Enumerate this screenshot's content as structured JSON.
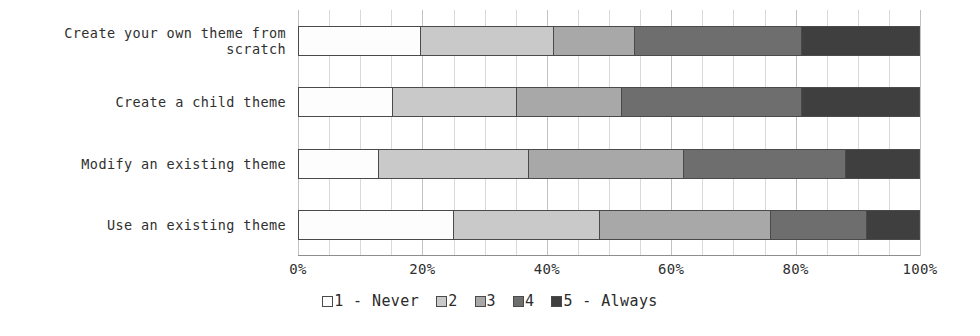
{
  "chart_data": {
    "type": "bar",
    "orientation": "horizontal",
    "stacked": true,
    "normalized_percent": true,
    "title": "",
    "subtitle": "",
    "xlabel": "",
    "ylabel": "",
    "xlim": [
      0,
      100
    ],
    "xticks": [
      "0%",
      "20%",
      "40%",
      "60%",
      "80%",
      "100%"
    ],
    "xtick_values": [
      0,
      20,
      40,
      60,
      80,
      100
    ],
    "grid": true,
    "grid_minor_step": 5,
    "legend_position": "bottom",
    "categories": [
      "Create your own theme from scratch",
      "Create a child theme",
      "Modify an existing theme",
      "Use an existing theme"
    ],
    "category_lines": [
      [
        "Create your own theme from",
        "scratch"
      ],
      [
        "Create a child theme"
      ],
      [
        "Modify an existing theme"
      ],
      [
        "Use an existing theme"
      ]
    ],
    "series": [
      {
        "name": "1 - Never",
        "color": "#fdfdfd",
        "values": [
          19.5,
          15.0,
          12.7,
          24.8
        ]
      },
      {
        "name": "2",
        "color": "#c9c9c9",
        "values": [
          21.5,
          20.0,
          24.3,
          23.6
        ]
      },
      {
        "name": "3",
        "color": "#a8a8a8",
        "values": [
          13.0,
          17.0,
          25.0,
          27.6
        ]
      },
      {
        "name": "4",
        "color": "#6e6e6e",
        "values": [
          27.0,
          29.0,
          26.0,
          15.5
        ]
      },
      {
        "name": "5 - Always",
        "color": "#3f3f3f",
        "values": [
          19.0,
          19.0,
          12.0,
          8.5
        ]
      }
    ],
    "legend": [
      {
        "label": "1 - Never",
        "swatch": "#fdfdfd"
      },
      {
        "label": "2",
        "swatch": "#c9c9c9"
      },
      {
        "label": "3",
        "swatch": "#a8a8a8"
      },
      {
        "label": "4",
        "swatch": "#6e6e6e"
      },
      {
        "label": "5 - Always",
        "swatch": "#3f3f3f"
      }
    ],
    "colors": {
      "bar_outline": "#4a4a4a",
      "gridline": "#d9d9d9",
      "axis": "#8e8e8e",
      "text": "#2b2b2b",
      "background": "#ffffff"
    }
  }
}
